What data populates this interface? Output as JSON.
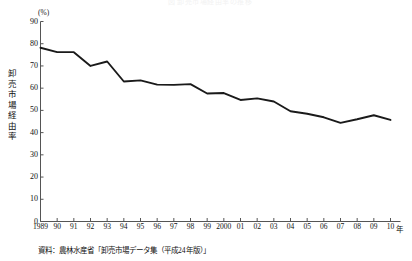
{
  "figure": {
    "faint_title": "図 卸売市場経由率の推移",
    "unit": "(%)",
    "y_axis_title": "卸売市場経由率",
    "x_axis_unit": "年",
    "source": "資料：農林水産省「卸売市場データ集（平成24年版）」"
  },
  "chart_data": {
    "type": "line",
    "title": "卸売市場経由率の推移",
    "xlabel": "年",
    "ylabel": "卸売市場経由率",
    "unit": "%",
    "ylim": [
      0,
      90
    ],
    "yticks": [
      0,
      10,
      20,
      30,
      40,
      50,
      60,
      70,
      80,
      90
    ],
    "ytick_labels": [
      "0",
      "10",
      "20",
      "30",
      "40",
      "50",
      "60",
      "70",
      "80",
      "90"
    ],
    "grid": false,
    "legend": "none",
    "categories": [
      "1989",
      "90",
      "91",
      "92",
      "93",
      "94",
      "95",
      "96",
      "97",
      "98",
      "99",
      "2000",
      "01",
      "02",
      "03",
      "04",
      "05",
      "06",
      "07",
      "08",
      "09",
      "10"
    ],
    "x": [
      1989,
      1990,
      1991,
      1992,
      1993,
      1994,
      1995,
      1996,
      1997,
      1998,
      1999,
      2000,
      2001,
      2002,
      2003,
      2004,
      2005,
      2006,
      2007,
      2008,
      2009,
      2010
    ],
    "values": [
      78.2,
      76.2,
      76.2,
      70.0,
      72.0,
      63.0,
      63.5,
      61.6,
      61.5,
      61.8,
      57.6,
      57.8,
      54.7,
      55.4,
      54.0,
      49.6,
      48.5,
      46.9,
      44.4,
      46.0,
      47.8,
      45.7
    ],
    "series": [
      {
        "name": "卸売市場経由率",
        "color": "#1a1a1a",
        "values": [
          78.2,
          76.2,
          76.2,
          70.0,
          72.0,
          63.0,
          63.5,
          61.6,
          61.5,
          61.8,
          57.6,
          57.8,
          54.7,
          55.4,
          54.0,
          49.6,
          48.5,
          46.9,
          44.4,
          46.0,
          47.8,
          45.7
        ]
      }
    ]
  },
  "colors": {
    "line": "#1a1a1a",
    "axis": "#555555",
    "text": "#111111",
    "background": "#ffffff"
  }
}
